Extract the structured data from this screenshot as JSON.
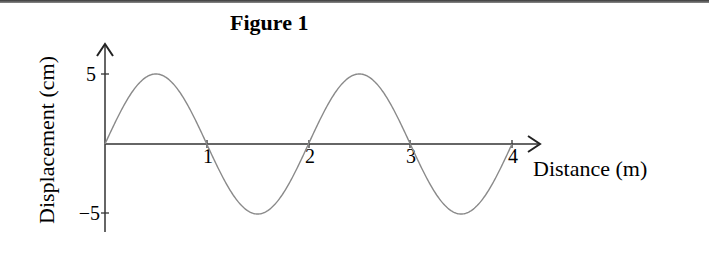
{
  "chart_data": {
    "type": "line",
    "title": "Figure 1",
    "xlabel": "Distance (m)",
    "ylabel": "Displacement (cm)",
    "x_ticks": [
      "1",
      "2",
      "3",
      "4"
    ],
    "y_ticks": [
      "5",
      "−5"
    ],
    "xlim": [
      0,
      4
    ],
    "ylim": [
      -5,
      5
    ],
    "grid": false,
    "legend": null,
    "series": [
      {
        "name": "wave",
        "function": "5*sin(pi*x)",
        "amplitude_cm": 5,
        "wavelength_m": 2,
        "x": [
          0,
          0.5,
          1,
          1.5,
          2,
          2.5,
          3,
          3.5,
          4
        ],
        "y": [
          0,
          5,
          0,
          -5,
          0,
          5,
          0,
          -5,
          0
        ]
      }
    ]
  },
  "labels": {
    "title": "Figure 1",
    "xlabel": "Distance (m)",
    "ylabel": "Displacement (cm)",
    "xt1": "1",
    "xt2": "2",
    "xt3": "3",
    "xt4": "4",
    "yt_pos": "5",
    "yt_neg": "−5"
  }
}
